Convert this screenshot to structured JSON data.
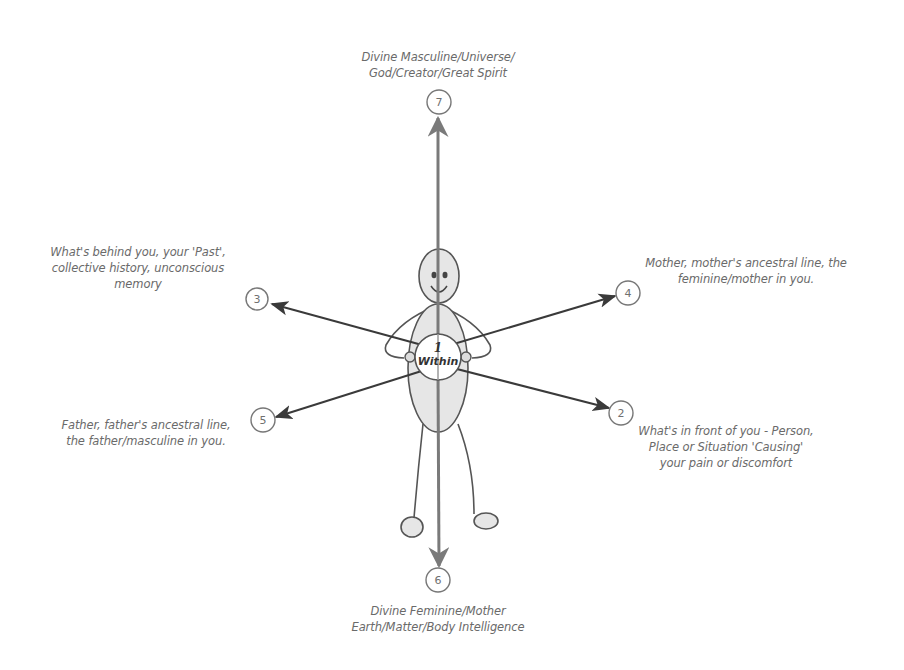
{
  "diagram": {
    "colors": {
      "background": "#ffffff",
      "arrow_dark": "#3a3a3a",
      "arrow_vertical": "#7a7a7a",
      "figure_stroke": "#555555",
      "figure_fill": "#e6e6e6",
      "label_text": "#6a6a6a",
      "node_stroke": "#777777"
    },
    "center": {
      "number": "1",
      "label": "Within"
    },
    "nodes": [
      {
        "id": "2",
        "number": "2",
        "direction": "front",
        "lines": [
          "What's in front of you - Person,",
          "Place or Situation 'Causing'",
          "your pain or discomfort"
        ]
      },
      {
        "id": "3",
        "number": "3",
        "direction": "behind",
        "lines": [
          "What's behind you, your 'Past',",
          "collective history, unconscious",
          "memory"
        ]
      },
      {
        "id": "4",
        "number": "4",
        "direction": "mother",
        "lines": [
          "Mother, mother's ancestral line, the",
          "feminine/mother in you."
        ]
      },
      {
        "id": "5",
        "number": "5",
        "direction": "father",
        "lines": [
          "Father, father's ancestral line,",
          "the father/masculine in you."
        ]
      },
      {
        "id": "6",
        "number": "6",
        "direction": "below",
        "lines": [
          "Divine Feminine/Mother",
          "Earth/Matter/Body Intelligence"
        ]
      },
      {
        "id": "7",
        "number": "7",
        "direction": "above",
        "lines": [
          "Divine Masculine/Universe/",
          "God/Creator/Great Spirit"
        ]
      }
    ]
  }
}
